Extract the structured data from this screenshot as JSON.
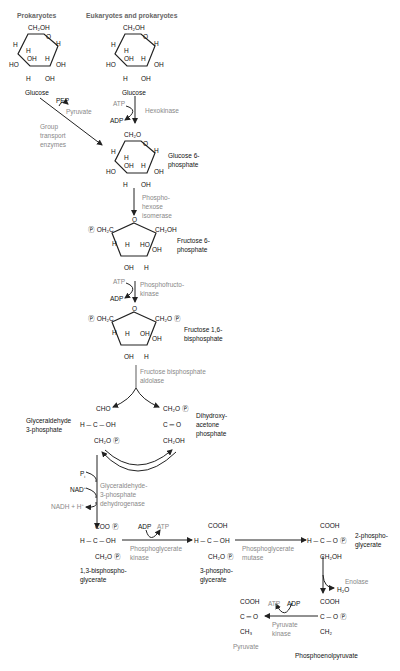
{
  "headers": {
    "left": "Prokaryotes",
    "right": "Eukaryotes and prokaryotes"
  },
  "compounds": {
    "glucose_left": "Glucose",
    "glucose_right": "Glucose",
    "g6p_1": "Glucose 6-",
    "g6p_2": "phosphate",
    "f6p_1": "Fructose 6-",
    "f6p_2": "phosphate",
    "f16bp_1": "Fructose 1,6-",
    "f16bp_2": "bisphosphate",
    "gap_1": "Glyceraldehyde",
    "gap_2": "3-phosphate",
    "dhap_1": "Dihydroxy-",
    "dhap_2": "acetone",
    "dhap_3": "phosphate",
    "bpg13_1": "1,3-bisphospho-",
    "bpg13_2": "glycerate",
    "pg3_1": "3-phospho-",
    "pg3_2": "glycerate",
    "pg2_1": "2-phospho-",
    "pg2_2": "glycerate",
    "pyruvate": "Pyruvate",
    "pep": "Phosphoenolpyruvate"
  },
  "enzymes": {
    "group_transport_1": "Group",
    "group_transport_2": "transport",
    "group_transport_3": "enzymes",
    "hexokinase": "Hexokinase",
    "phi_1": "Phospho-",
    "phi_2": "hexose",
    "phi_3": "isomerase",
    "pfk_1": "Phosphofructo-",
    "pfk_2": "kinase",
    "aldolase_1": "Fructose bisphosphate",
    "aldolase_2": "aldolase",
    "gapdh_1": "Glyceraldehyde-",
    "gapdh_2": "3-phosphate",
    "gapdh_3": "dehydrogenase",
    "pgk_1": "Phosphoglycerate",
    "pgk_2": "kinase",
    "pgm_1": "Phosphoglycerate",
    "pgm_2": "mutase",
    "enolase": "Enolase",
    "pk_1": "Pyruvate",
    "pk_2": "kinase"
  },
  "cofactors": {
    "pep": "PEP",
    "pyruvate_out": "Pyruvate",
    "atp1": "ATP",
    "adp1": "ADP",
    "atp2": "ATP",
    "adp2": "ADP",
    "pi": "P",
    "pi_sub": "i",
    "nad": "NAD",
    "nad_sup": "+",
    "nadh": "NADH + H",
    "nadh_sup": "+",
    "adp3": "ADP",
    "atp3": "ATP",
    "h2o": "H₂O",
    "atp4": "ATP",
    "adp4": "ADP"
  },
  "atoms": {
    "ch2oh": "CH₂OH",
    "ch2op": "CH₂O",
    "poh2c": "OH₂C",
    "o": "O",
    "h": "H",
    "oh": "OH",
    "ho": "HO",
    "p": "P",
    "cho": "CHO",
    "c_eq_o": "C ═ O",
    "h_c_oh": "H ─ C ─ OH",
    "coo": "COO",
    "cooh": "COOH",
    "h_c": "H ─ C ─ O",
    "c_o": "C ─ O",
    "ch2": "CH₂",
    "ch3": "CH₃",
    "c": "C",
    "dbl": "‖"
  },
  "colors": {
    "text": "#111111",
    "enzyme_gray": "#888888",
    "header_gray": "#666666",
    "line": "#222222",
    "line_gray": "#777777"
  }
}
